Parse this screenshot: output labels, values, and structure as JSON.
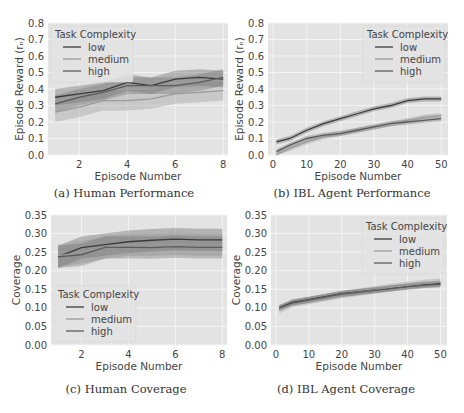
{
  "figure": {
    "panels": [
      {
        "id": "a",
        "caption": "(a) Human Performance"
      },
      {
        "id": "b",
        "caption": "(b) IBL Agent Performance"
      },
      {
        "id": "c",
        "caption": "(c) Human Coverage"
      },
      {
        "id": "d",
        "caption": "(d) IBL Agent Coverage"
      }
    ]
  },
  "colors": {
    "plot_bg": "#e3e3e3",
    "grid": "#f4f4f4",
    "low": "#3a3a3a",
    "medium": "#9a9a9a",
    "high": "#5c5c5c",
    "band_low": "rgba(90,90,90,0.35)",
    "band_medium": "rgba(150,150,150,0.35)",
    "band_high": "rgba(110,110,110,0.35)",
    "text": "#444444"
  },
  "chart_data": [
    {
      "type": "line",
      "title": "",
      "caption": "(a) Human Performance",
      "xlabel": "Episode Number",
      "ylabel": "Episode Reward (r_n)",
      "xlim": [
        0.7,
        8.2
      ],
      "ylim": [
        0.0,
        0.8
      ],
      "xticks": [
        2,
        4,
        6,
        8
      ],
      "yticks": [
        0.0,
        0.1,
        0.2,
        0.3,
        0.4,
        0.5,
        0.6,
        0.7,
        0.8
      ],
      "grid": true,
      "legend": {
        "title": "Task Complexity",
        "position": "upper left",
        "entries": [
          "low",
          "medium",
          "high"
        ]
      },
      "x": [
        1,
        2,
        3,
        4,
        5,
        6,
        7,
        8
      ],
      "series": [
        {
          "name": "low",
          "values": [
            0.35,
            0.37,
            0.39,
            0.44,
            0.42,
            0.46,
            0.47,
            0.46
          ],
          "ci": 0.05
        },
        {
          "name": "medium",
          "values": [
            0.26,
            0.29,
            0.33,
            0.33,
            0.34,
            0.37,
            0.38,
            0.39
          ],
          "ci": 0.06
        },
        {
          "name": "high",
          "values": [
            0.31,
            0.35,
            0.38,
            0.42,
            0.42,
            0.42,
            0.44,
            0.47
          ],
          "ci": 0.05
        }
      ]
    },
    {
      "type": "line",
      "title": "",
      "caption": "(b) IBL Agent Performance",
      "xlabel": "Episode Number",
      "ylabel": "Episode Reward (r_n)",
      "xlim": [
        -1.5,
        52
      ],
      "ylim": [
        0.0,
        0.8
      ],
      "xticks": [
        0,
        10,
        20,
        30,
        40,
        50
      ],
      "yticks": [
        0.0,
        0.1,
        0.2,
        0.3,
        0.4,
        0.5,
        0.6,
        0.7,
        0.8
      ],
      "grid": true,
      "legend": {
        "title": "Task Complexity",
        "position": "upper right",
        "entries": [
          "low",
          "medium",
          "high"
        ]
      },
      "x": [
        1,
        5,
        10,
        15,
        20,
        25,
        30,
        35,
        40,
        45,
        50
      ],
      "series": [
        {
          "name": "low",
          "values": [
            0.08,
            0.1,
            0.15,
            0.19,
            0.22,
            0.25,
            0.28,
            0.3,
            0.33,
            0.34,
            0.34
          ],
          "ci": 0.015
        },
        {
          "name": "medium",
          "values": [
            0.0,
            0.04,
            0.08,
            0.11,
            0.13,
            0.15,
            0.17,
            0.19,
            0.21,
            0.23,
            0.24
          ],
          "ci": 0.015
        },
        {
          "name": "high",
          "values": [
            0.02,
            0.06,
            0.1,
            0.12,
            0.13,
            0.15,
            0.17,
            0.19,
            0.2,
            0.21,
            0.22
          ],
          "ci": 0.015
        }
      ]
    },
    {
      "type": "line",
      "title": "",
      "caption": "(c) Human Coverage",
      "xlabel": "Episode Number",
      "ylabel": "Coverage",
      "xlim": [
        0.7,
        8.2
      ],
      "ylim": [
        0.0,
        0.35
      ],
      "xticks": [
        2,
        4,
        6,
        8
      ],
      "yticks": [
        0.0,
        0.05,
        0.1,
        0.15,
        0.2,
        0.25,
        0.3,
        0.35
      ],
      "grid": true,
      "legend": {
        "title": "Task Complexity",
        "position": "lower left",
        "entries": [
          "low",
          "medium",
          "high"
        ]
      },
      "x": [
        1,
        2,
        3,
        4,
        5,
        6,
        7,
        8
      ],
      "series": [
        {
          "name": "low",
          "values": [
            0.237,
            0.262,
            0.27,
            0.278,
            0.282,
            0.285,
            0.283,
            0.283
          ],
          "ci": 0.03
        },
        {
          "name": "medium",
          "values": [
            0.24,
            0.25,
            0.262,
            0.27,
            0.27,
            0.272,
            0.27,
            0.27
          ],
          "ci": 0.03
        },
        {
          "name": "high",
          "values": [
            0.237,
            0.243,
            0.263,
            0.263,
            0.262,
            0.265,
            0.263,
            0.263
          ],
          "ci": 0.03
        }
      ]
    },
    {
      "type": "line",
      "title": "",
      "caption": "(d) IBL Agent Coverage",
      "xlabel": "Episode Number",
      "ylabel": "Coverage",
      "xlim": [
        -1.5,
        52
      ],
      "ylim": [
        0.0,
        0.35
      ],
      "xticks": [
        0,
        10,
        20,
        30,
        40,
        50
      ],
      "yticks": [
        0.0,
        0.05,
        0.1,
        0.15,
        0.2,
        0.25,
        0.3,
        0.35
      ],
      "grid": true,
      "legend": {
        "title": "Task Complexity",
        "position": "upper right",
        "entries": [
          "low",
          "medium",
          "high"
        ]
      },
      "x": [
        1,
        5,
        10,
        15,
        20,
        25,
        30,
        35,
        40,
        45,
        50
      ],
      "series": [
        {
          "name": "low",
          "values": [
            0.1,
            0.115,
            0.122,
            0.13,
            0.138,
            0.143,
            0.148,
            0.153,
            0.158,
            0.162,
            0.165
          ],
          "ci": 0.008
        },
        {
          "name": "medium",
          "values": [
            0.095,
            0.112,
            0.12,
            0.128,
            0.136,
            0.142,
            0.148,
            0.155,
            0.16,
            0.166,
            0.17
          ],
          "ci": 0.01
        },
        {
          "name": "high",
          "values": [
            0.1,
            0.113,
            0.121,
            0.129,
            0.137,
            0.142,
            0.147,
            0.152,
            0.157,
            0.161,
            0.163
          ],
          "ci": 0.008
        }
      ]
    }
  ],
  "layout_boxes": [
    {
      "left": 48,
      "top": 23,
      "right": 228,
      "bottom": 155,
      "caption_x": 124,
      "caption_y": 186
    },
    {
      "left": 268,
      "top": 23,
      "right": 448,
      "bottom": 155,
      "caption_x": 352,
      "caption_y": 186
    },
    {
      "left": 51,
      "top": 215,
      "right": 227,
      "bottom": 345,
      "caption_x": 126,
      "caption_y": 382
    },
    {
      "left": 271,
      "top": 215,
      "right": 447,
      "bottom": 345,
      "caption_x": 346,
      "caption_y": 382
    }
  ]
}
